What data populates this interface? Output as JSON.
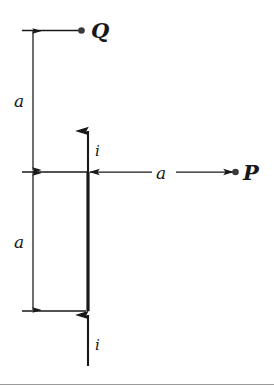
{
  "figure": {
    "background_color": "#ffffff",
    "ink_color": "#181818",
    "labels": {
      "point_q": "Q",
      "point_p": "P",
      "current_upper": "i",
      "current_lower": "i",
      "distance_top": "a",
      "distance_bottom": "a",
      "distance_right": "a"
    },
    "geometry": {
      "wire_x": 88,
      "wire_top_y": 172,
      "wire_bottom_y": 311,
      "point_q_x": 81,
      "point_q_y": 31,
      "point_p_x": 235,
      "point_p_y": 172,
      "dimension_line_x": 33,
      "tick_left_x": 22
    },
    "footer_rule": true
  }
}
